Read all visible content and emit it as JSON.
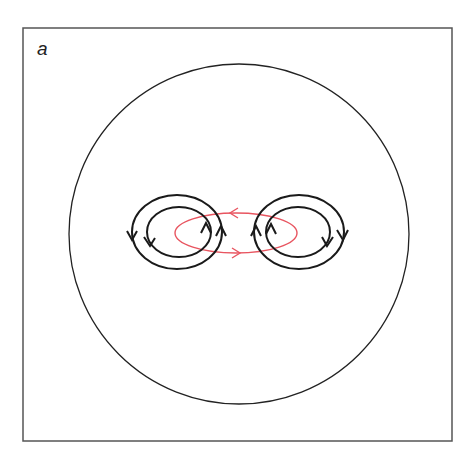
{
  "figure": {
    "panel_label": "a",
    "frame": {
      "x": 23,
      "y": 28,
      "width": 429,
      "height": 413,
      "stroke": "#555555"
    },
    "outer_circle": {
      "cx": 239,
      "cy": 234,
      "r": 170,
      "stroke": "#222222"
    },
    "left_loops": {
      "outer": {
        "cx": 177,
        "cy": 232,
        "rx": 45,
        "ry": 37,
        "direction": "counter-clockwise"
      },
      "inner": {
        "cx": 179,
        "cy": 232,
        "rx": 32,
        "ry": 25,
        "direction": "counter-clockwise"
      }
    },
    "right_loops": {
      "outer": {
        "cx": 299,
        "cy": 232,
        "rx": 45,
        "ry": 37,
        "direction": "clockwise"
      },
      "inner": {
        "cx": 298,
        "cy": 232,
        "rx": 32,
        "ry": 25,
        "direction": "clockwise"
      }
    },
    "red_loop": {
      "cx": 236,
      "cy": 233,
      "rx": 61,
      "ry": 20,
      "stroke": "#e85560",
      "top_arrow": "left",
      "bottom_arrow": "right"
    },
    "loop_stroke": "#1a1a1a"
  }
}
